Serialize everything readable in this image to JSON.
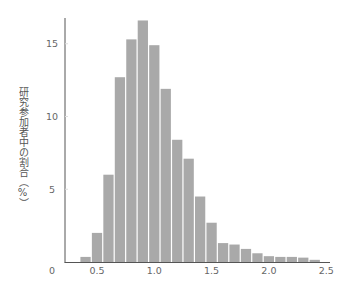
{
  "chart_data": {
    "type": "bar",
    "title": "",
    "xlabel": "",
    "ylabel": "研究参加者中の割合（%）",
    "xlim": [
      0.35,
      2.5
    ],
    "ylim": [
      0,
      17
    ],
    "grid": false,
    "legend": null,
    "bin_width": 0.1,
    "x_ticks": [
      0.5,
      1.0,
      1.5,
      2.0,
      2.5
    ],
    "x_tick_labels": [
      "0.5",
      "1.0",
      "1.5",
      "2.0",
      "2.5"
    ],
    "y_ticks": [
      0,
      5,
      10,
      15
    ],
    "y_tick_labels": [
      "0",
      "5",
      "10",
      "15"
    ],
    "bar_color": "#a9a9a9",
    "categories": [
      0.4,
      0.5,
      0.6,
      0.7,
      0.8,
      0.9,
      1.0,
      1.1,
      1.2,
      1.3,
      1.4,
      1.5,
      1.6,
      1.7,
      1.8,
      1.9,
      2.0,
      2.1,
      2.2,
      2.3,
      2.4
    ],
    "values": [
      0.35,
      2.0,
      6.0,
      12.7,
      15.3,
      16.6,
      14.9,
      11.9,
      8.4,
      7.1,
      4.5,
      2.7,
      1.3,
      1.2,
      0.9,
      0.6,
      0.4,
      0.35,
      0.35,
      0.3,
      0.15
    ]
  },
  "axis": {
    "y_label_text": "研究参加者中の割合（%）"
  }
}
